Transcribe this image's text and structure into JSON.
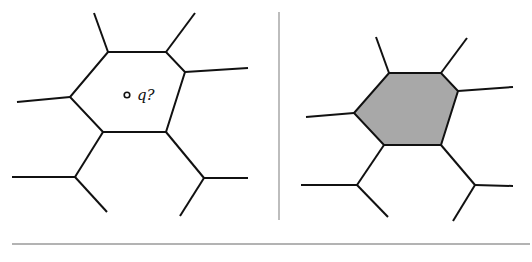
{
  "figure": {
    "left_panel": {
      "query_label": "q?",
      "query_point": {
        "x": 127,
        "y": 95
      },
      "cell_vertices": [
        [
          108,
          52
        ],
        [
          166,
          52
        ],
        [
          185,
          72
        ],
        [
          166,
          132
        ],
        [
          103,
          132
        ],
        [
          70,
          97
        ]
      ],
      "highlighted": false
    },
    "right_panel": {
      "cell_vertices": [
        [
          389,
          73
        ],
        [
          441,
          73
        ],
        [
          458,
          91
        ],
        [
          441,
          145
        ],
        [
          384,
          145
        ],
        [
          354,
          113
        ]
      ],
      "highlighted": true
    },
    "colors": {
      "edge": "#111111",
      "cell_fill": "#a8a8a8",
      "rule": "#9a9a9a",
      "background": "#ffffff"
    }
  }
}
